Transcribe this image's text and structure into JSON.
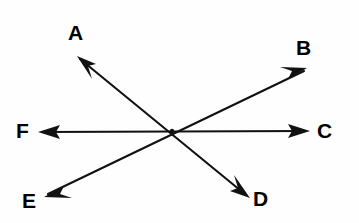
{
  "figure": {
    "background_color": "#fefefe",
    "line_color": "#111111",
    "label_color": "#000000",
    "vertex": {
      "x": 172,
      "y": 131
    },
    "rays": [
      {
        "id": "ray-a",
        "label": "A",
        "label_x": 68,
        "label_y": 22,
        "tip_x": 77,
        "tip_y": 56,
        "tail_x": 250,
        "tail_y": 198,
        "angle_deg": 140.6,
        "direction": "upper-left"
      },
      {
        "id": "ray-b",
        "label": "B",
        "label_x": 296,
        "label_y": 37,
        "tip_x": 307,
        "tip_y": 68,
        "tail_x": 44,
        "tail_y": 197,
        "angle_deg": 26.1,
        "direction": "upper-right"
      },
      {
        "id": "ray-c",
        "label": "C",
        "label_x": 317,
        "label_y": 120,
        "tip_x": 310,
        "tip_y": 131,
        "tail_x": 38,
        "tail_y": 132,
        "angle_deg": 0.2,
        "direction": "right"
      },
      {
        "id": "ray-d",
        "label": "D",
        "label_x": 253,
        "label_y": 188,
        "tip_x": 250,
        "tip_y": 198,
        "tail_x": 77,
        "tail_y": 56,
        "angle_deg": -39.4,
        "direction": "lower-right"
      },
      {
        "id": "ray-e",
        "label": "E",
        "label_x": 22,
        "label_y": 190,
        "tip_x": 44,
        "tip_y": 197,
        "tail_x": 307,
        "tail_y": 68,
        "angle_deg": -153.9,
        "direction": "lower-left"
      },
      {
        "id": "ray-f",
        "label": "F",
        "label_x": 16,
        "label_y": 120,
        "tip_x": 38,
        "tip_y": 132,
        "tail_x": 310,
        "tail_y": 131,
        "angle_deg": 179.8,
        "direction": "left"
      }
    ]
  }
}
